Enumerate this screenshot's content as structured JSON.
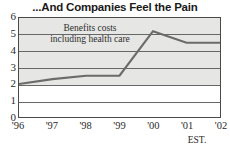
{
  "chart_data": {
    "type": "line",
    "title": "...And Companies Feel the Pain",
    "xlabel": "",
    "ylabel": "",
    "ylim": [
      0,
      6
    ],
    "yticks": [
      "0",
      "1",
      "2",
      "3",
      "4",
      "5",
      "6"
    ],
    "grid": true,
    "legend": "none",
    "categories": [
      "'96",
      "'97",
      "'98",
      "'99",
      "'00",
      "'01",
      "'02"
    ],
    "x": [
      1996,
      1997,
      1998,
      1999,
      2000,
      2001,
      2002
    ],
    "values": [
      2.0,
      2.3,
      2.5,
      2.5,
      5.2,
      4.5,
      4.5
    ],
    "series": [
      {
        "name": "Benefits costs including health care",
        "values": [
          2.0,
          2.3,
          2.5,
          2.5,
          5.2,
          4.5,
          4.5
        ]
      }
    ],
    "annotations": [
      {
        "text_line1": "Benefits costs",
        "text_line2": "including health care"
      },
      {
        "text": "EST.",
        "covers": [
          "'01",
          "'02"
        ]
      }
    ]
  },
  "axis": {
    "y_labels": [
      "6",
      "5",
      "4",
      "3",
      "2",
      "1",
      "0"
    ],
    "x_labels": [
      "'96",
      "'97",
      "'98",
      "'99",
      "'00",
      "'01",
      "'02"
    ]
  },
  "annotation": {
    "line1": "Benefits costs",
    "line2": "including health care"
  },
  "estimate": {
    "label": "EST."
  },
  "colors": {
    "line": "#6b6b6b",
    "band": "#e6e6e4",
    "grid": "#676767",
    "frame": "#4a4a4a",
    "text": "#1a1a1a"
  }
}
